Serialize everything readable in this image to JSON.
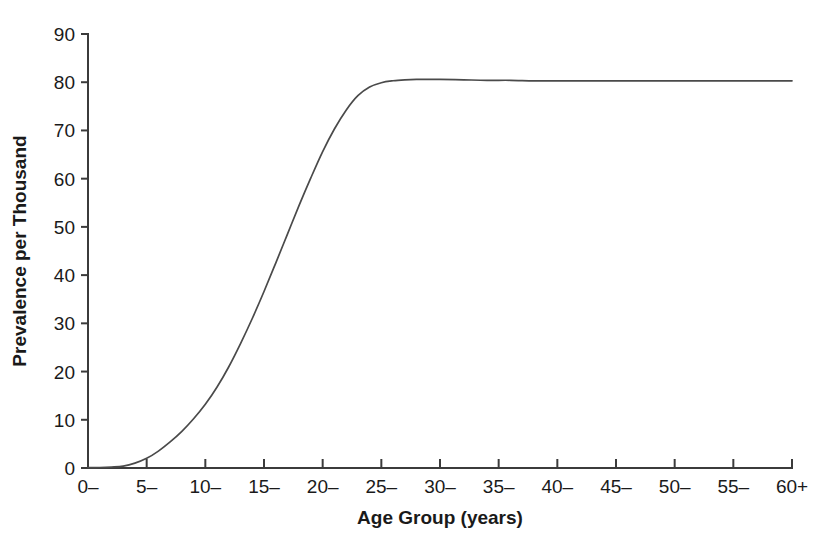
{
  "chart_data": {
    "type": "line",
    "title": "",
    "subtitle": "",
    "xlabel": "Age Group (years)",
    "ylabel": "Prevalence per Thousand",
    "grid": false,
    "legend": "none",
    "xlim": [
      0,
      60
    ],
    "ylim": [
      0,
      90
    ],
    "x_tick_labels": [
      "0–",
      "5–",
      "10–",
      "15–",
      "20–",
      "25–",
      "30–",
      "35–",
      "40–",
      "45–",
      "50–",
      "55–",
      "60+"
    ],
    "x_tick_values": [
      0,
      5,
      10,
      15,
      20,
      25,
      30,
      35,
      40,
      45,
      50,
      55,
      60
    ],
    "y_tick_labels": [
      "0",
      "10",
      "20",
      "30",
      "40",
      "50",
      "60",
      "70",
      "80",
      "90"
    ],
    "y_tick_values": [
      0,
      10,
      20,
      30,
      40,
      50,
      60,
      70,
      80,
      90
    ],
    "series": [
      {
        "name": "Prevalence",
        "color": "#4a4a4a",
        "x": [
          0,
          1,
          2,
          3,
          4,
          5,
          6,
          7,
          8,
          9,
          10,
          11,
          12,
          13,
          14,
          15,
          16,
          17,
          18,
          19,
          20,
          21,
          22,
          23,
          24,
          25,
          26,
          27,
          28,
          29,
          30,
          32,
          34,
          36,
          38,
          40,
          42,
          44,
          46,
          48,
          50,
          52,
          54,
          56,
          58,
          60
        ],
        "values": [
          0.1,
          0.1,
          0.2,
          0.4,
          1.0,
          2.0,
          3.5,
          5.4,
          7.6,
          10.2,
          13.2,
          16.8,
          21.0,
          25.8,
          31.0,
          36.6,
          42.5,
          48.5,
          54.5,
          60.2,
          65.6,
          70.3,
          74.2,
          77.2,
          79.0,
          79.9,
          80.3,
          80.5,
          80.6,
          80.6,
          80.6,
          80.5,
          80.4,
          80.4,
          80.3,
          80.3,
          80.3,
          80.3,
          80.3,
          80.3,
          80.3,
          80.3,
          80.3,
          80.3,
          80.3,
          80.3
        ]
      }
    ]
  },
  "axes": {
    "x_label": "Age Group (years)",
    "y_label": "Prevalence per Thousand"
  },
  "colors": {
    "line": "#4a4a4a",
    "axis": "#3b3b3b",
    "text": "#1a1a1a",
    "background": "#ffffff"
  }
}
